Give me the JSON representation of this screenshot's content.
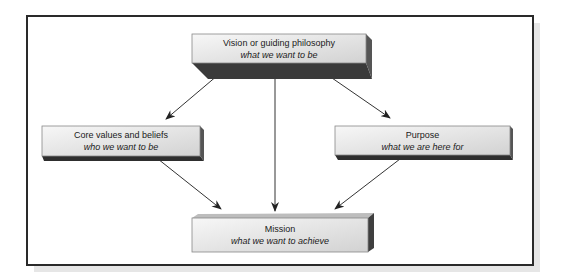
{
  "diagram": {
    "nodes": {
      "vision": {
        "title": "Vision or guiding philosophy",
        "subtitle": "what we want to be"
      },
      "core_values": {
        "title": "Core values and beliefs",
        "subtitle": "who we want to be"
      },
      "purpose": {
        "title": "Purpose",
        "subtitle": "what we are here for"
      },
      "mission": {
        "title": "Mission",
        "subtitle": "what we want to achieve"
      }
    },
    "edges": [
      {
        "from": "vision",
        "to": "core_values"
      },
      {
        "from": "vision",
        "to": "purpose"
      },
      {
        "from": "vision",
        "to": "mission"
      },
      {
        "from": "core_values",
        "to": "mission"
      },
      {
        "from": "purpose",
        "to": "mission"
      }
    ],
    "colors": {
      "frame_border": "#2a2a2a",
      "frame_shadow": "#e6e6e6",
      "box_face_light": "#f4f4f4",
      "box_face_dark": "#d4d4d4",
      "box_side": "#3a3a3a",
      "arrow": "#333333"
    }
  }
}
